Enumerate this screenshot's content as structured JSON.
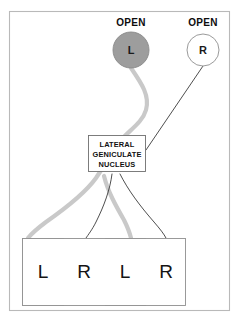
{
  "figure": {
    "background_color": "#ffffff",
    "frame": {
      "border_color": "#b9b9b9"
    }
  },
  "eyes": [
    {
      "id": "left-eye",
      "letter": "L",
      "status_label": "OPEN",
      "state": "filled",
      "fill_color": "#9d9d9d",
      "cx": 131,
      "cy": 50,
      "r": 18,
      "label_x": 131,
      "label_y": 22
    },
    {
      "id": "right-eye",
      "letter": "R",
      "status_label": "OPEN",
      "state": "open",
      "fill_color": "#ffffff",
      "cx": 203,
      "cy": 50,
      "r": 16,
      "label_x": 203,
      "label_y": 22
    }
  ],
  "lgn": {
    "lines": [
      "LATERAL",
      "GENICULATE",
      "NUCLEUS"
    ],
    "x": 88,
    "y": 135,
    "width": 58,
    "height": 37,
    "border_color": "#6f6f6f"
  },
  "pathways": [
    {
      "id": "left-eye-pathway",
      "source": "left-eye",
      "color": "#c9c9c9",
      "width": 4.2
    },
    {
      "id": "right-eye-pathway",
      "source": "right-eye",
      "color": "#3a3a3a",
      "width": 0.9
    }
  ],
  "cortex": {
    "label": "visual cortex ocular dominance columns",
    "x": 22,
    "y": 238,
    "width": 164,
    "height": 68,
    "outline_color": "#8f8f8f",
    "stripes": [
      {
        "letter": "L",
        "eye": "left",
        "fill": "#ababab",
        "x": 22,
        "width": 42
      },
      {
        "letter": "R",
        "eye": "right",
        "fill": "#ffffff",
        "x": 64,
        "width": 41
      },
      {
        "letter": "L",
        "eye": "left",
        "fill": "#ababab",
        "x": 105,
        "width": 41
      },
      {
        "letter": "R",
        "eye": "right",
        "fill": "#ffffff",
        "x": 146,
        "width": 40
      }
    ]
  },
  "geometry": {
    "left_path_d": "M 131 68 C 142 84 150 96 146 110 C 142 124 126 132 118 144 C 110 156 104 166 96 178 C 86 192 66 208 46 222 C 38 228 32 233 28 238",
    "left_path_branch_d": "M 104 176 C 108 192 116 206 124 220 C 128 228 130 234 131 238",
    "right_path_main_d": "M 203 66 L 146 150",
    "right_path_branch_a_d": "M 112 174 C 110 190 104 206 96 222 C 92 230 88 235 86 238",
    "right_path_branch_b_d": "M 120 174 C 128 190 140 206 154 222 C 160 229 164 234 166 238"
  }
}
